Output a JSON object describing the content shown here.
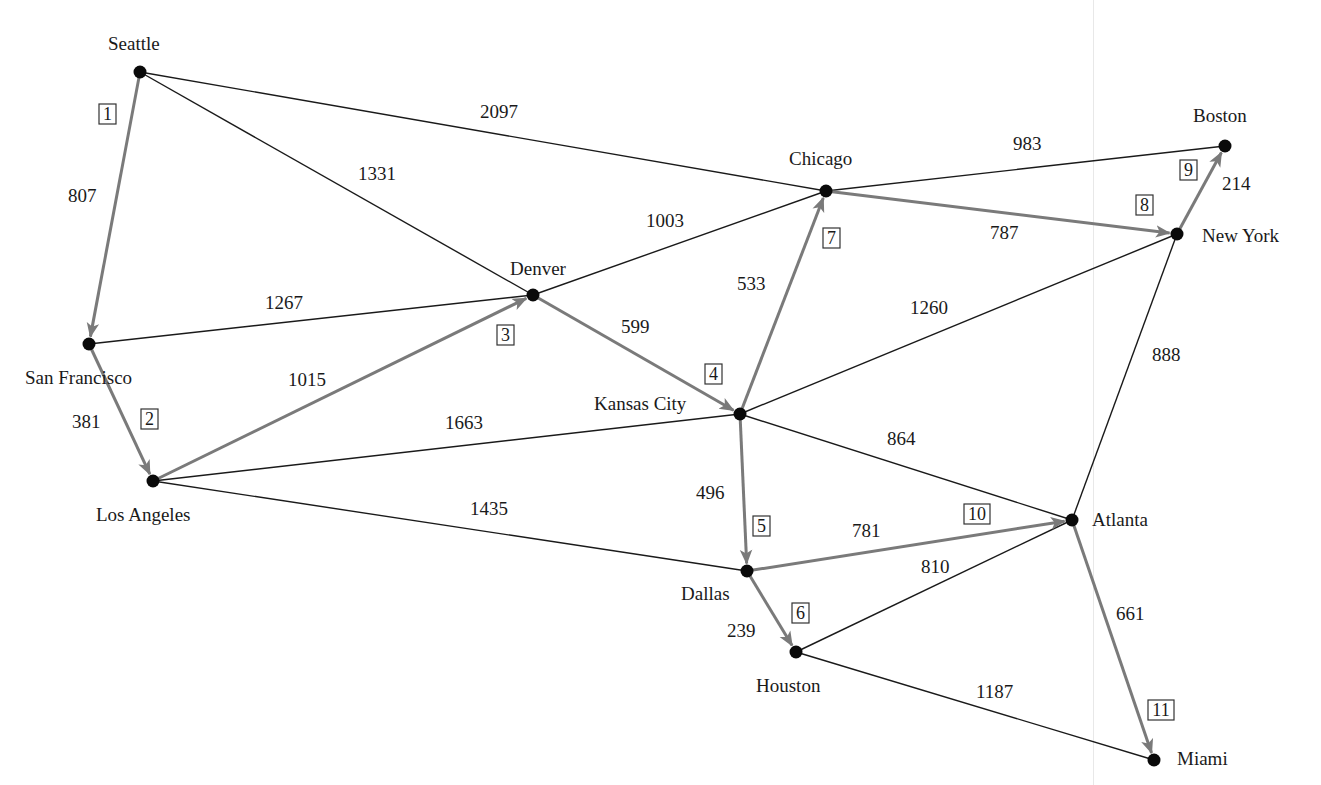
{
  "figure": {
    "colors": {
      "edge": "#1a1a1a",
      "tree_edge": "#7a7a7a",
      "node": "#0a0a0a",
      "background": "#ffffff"
    }
  },
  "nodes": [
    {
      "id": "seattle",
      "label": "Seattle",
      "x": 140,
      "y": 72,
      "lx": 108,
      "ly": 50
    },
    {
      "id": "sanfrancisco",
      "label": "San Francisco",
      "x": 89,
      "y": 344,
      "lx": 25,
      "ly": 384
    },
    {
      "id": "losangeles",
      "label": "Los Angeles",
      "x": 153,
      "y": 481,
      "lx": 96,
      "ly": 521
    },
    {
      "id": "denver",
      "label": "Denver",
      "x": 533,
      "y": 295,
      "lx": 510,
      "ly": 275
    },
    {
      "id": "chicago",
      "label": "Chicago",
      "x": 826,
      "y": 191,
      "lx": 789,
      "ly": 165
    },
    {
      "id": "kansascity",
      "label": "Kansas City",
      "x": 740,
      "y": 414,
      "lx": 594,
      "ly": 410
    },
    {
      "id": "dallas",
      "label": "Dallas",
      "x": 747,
      "y": 571,
      "lx": 681,
      "ly": 600
    },
    {
      "id": "houston",
      "label": "Houston",
      "x": 796,
      "y": 652,
      "lx": 756,
      "ly": 692
    },
    {
      "id": "atlanta",
      "label": "Atlanta",
      "x": 1072,
      "y": 520,
      "lx": 1092,
      "ly": 526
    },
    {
      "id": "miami",
      "label": "Miami",
      "x": 1154,
      "y": 760,
      "lx": 1177,
      "ly": 765
    },
    {
      "id": "newyork",
      "label": "New York",
      "x": 1177,
      "y": 234,
      "lx": 1202,
      "ly": 242
    },
    {
      "id": "boston",
      "label": "Boston",
      "x": 1225,
      "y": 146,
      "lx": 1193,
      "ly": 122
    }
  ],
  "edges": [
    {
      "from": "seattle",
      "to": "chicago",
      "weight": "2097",
      "tree": false,
      "wx": 480,
      "wy": 118
    },
    {
      "from": "seattle",
      "to": "denver",
      "weight": "1331",
      "tree": false,
      "wx": 358,
      "wy": 180
    },
    {
      "from": "seattle",
      "to": "sanfrancisco",
      "weight": "807",
      "tree": true,
      "step": "1",
      "wx": 68,
      "wy": 202,
      "bx": 99,
      "by": 104
    },
    {
      "from": "sanfrancisco",
      "to": "denver",
      "weight": "1267",
      "tree": false,
      "wx": 265,
      "wy": 309
    },
    {
      "from": "sanfrancisco",
      "to": "losangeles",
      "weight": "381",
      "tree": true,
      "step": "2",
      "wx": 72,
      "wy": 428,
      "bx": 141,
      "by": 409
    },
    {
      "from": "losangeles",
      "to": "denver",
      "weight": "1015",
      "tree": true,
      "step": "3",
      "wx": 288,
      "wy": 386,
      "bx": 497,
      "by": 325
    },
    {
      "from": "losangeles",
      "to": "kansascity",
      "weight": "1663",
      "tree": false,
      "wx": 445,
      "wy": 429
    },
    {
      "from": "losangeles",
      "to": "dallas",
      "weight": "1435",
      "tree": false,
      "wx": 470,
      "wy": 515
    },
    {
      "from": "denver",
      "to": "chicago",
      "weight": "1003",
      "tree": false,
      "wx": 646,
      "wy": 227
    },
    {
      "from": "denver",
      "to": "kansascity",
      "weight": "599",
      "tree": true,
      "step": "4",
      "wx": 621,
      "wy": 333,
      "bx": 705,
      "by": 364
    },
    {
      "from": "kansascity",
      "to": "chicago",
      "weight": "533",
      "tree": true,
      "step": "7",
      "wx": 737,
      "wy": 290,
      "bx": 823,
      "by": 228
    },
    {
      "from": "kansascity",
      "to": "newyork",
      "weight": "1260",
      "tree": false,
      "wx": 910,
      "wy": 314
    },
    {
      "from": "kansascity",
      "to": "atlanta",
      "weight": "864",
      "tree": false,
      "wx": 887,
      "wy": 445
    },
    {
      "from": "kansascity",
      "to": "dallas",
      "weight": "496",
      "tree": true,
      "step": "5",
      "wx": 696,
      "wy": 499,
      "bx": 753,
      "by": 516
    },
    {
      "from": "chicago",
      "to": "boston",
      "weight": "983",
      "tree": false,
      "wx": 1013,
      "wy": 150
    },
    {
      "from": "chicago",
      "to": "newyork",
      "weight": "787",
      "tree": true,
      "step": "8",
      "wx": 990,
      "wy": 239,
      "bx": 1136,
      "by": 195
    },
    {
      "from": "newyork",
      "to": "boston",
      "weight": "214",
      "tree": true,
      "step": "9",
      "wx": 1222,
      "wy": 190,
      "bx": 1180,
      "by": 160
    },
    {
      "from": "newyork",
      "to": "atlanta",
      "weight": "888",
      "tree": false,
      "wx": 1152,
      "wy": 361
    },
    {
      "from": "dallas",
      "to": "atlanta",
      "weight": "781",
      "tree": true,
      "step": "10",
      "wx": 852,
      "wy": 537,
      "bx": 964,
      "by": 504
    },
    {
      "from": "dallas",
      "to": "houston",
      "weight": "239",
      "tree": true,
      "step": "6",
      "wx": 727,
      "wy": 637,
      "bx": 792,
      "by": 603
    },
    {
      "from": "houston",
      "to": "atlanta",
      "weight": "810",
      "tree": false,
      "wx": 921,
      "wy": 573
    },
    {
      "from": "houston",
      "to": "miami",
      "weight": "1187",
      "tree": false,
      "wx": 976,
      "wy": 698
    },
    {
      "from": "atlanta",
      "to": "miami",
      "weight": "661",
      "tree": true,
      "step": "11",
      "wx": 1116,
      "wy": 620,
      "bx": 1148,
      "by": 700
    }
  ]
}
